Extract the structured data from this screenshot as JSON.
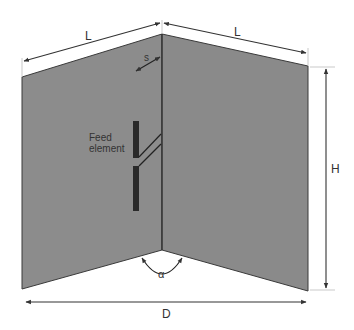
{
  "diagram": {
    "type": "corner reflector antenna",
    "labels": {
      "length_left": "L",
      "length_right": "L",
      "height": "H",
      "width": "D",
      "spacing": "s",
      "angle": "α",
      "feed_line1": "Feed",
      "feed_line2": "element"
    },
    "colors": {
      "panel_fill": "#8c8c8c",
      "panel_edge": "#3a3a3a",
      "feed_fill": "#2a2a2a",
      "dimension_line": "#333333",
      "background": "#ffffff"
    }
  }
}
